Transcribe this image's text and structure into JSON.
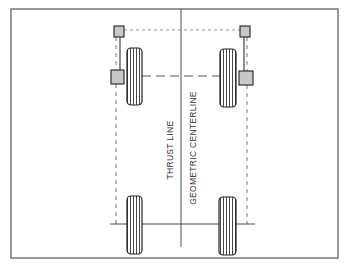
{
  "diagram": {
    "labels": {
      "thrust_line": "THRUST LINE",
      "geometric_centerline": "GEOMETRIC CENTERLINE"
    },
    "colors": {
      "line": "#3a3a3a",
      "border": "#7a7a7a",
      "sensor_fill": "#c8c8c8",
      "background": "#ffffff"
    },
    "components": {
      "tires": [
        "front-left",
        "front-right",
        "rear-left",
        "rear-right"
      ],
      "sensors": [
        "front-left-small",
        "front-right-small",
        "front-left-large",
        "front-right-large"
      ]
    }
  }
}
